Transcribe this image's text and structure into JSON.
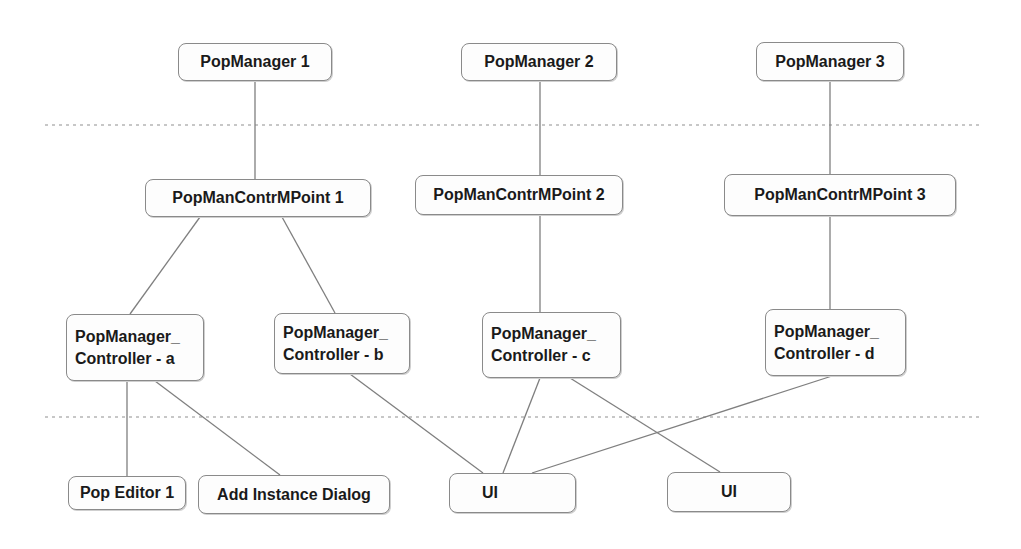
{
  "diagram": {
    "colors": {
      "edge": "#7f7f7f",
      "separator": "#b5b5b5",
      "node_border": "#8a8a8a",
      "text": "#1a1a1a"
    },
    "separators": [
      {
        "name": "separator-top",
        "x1": 45,
        "x2": 980,
        "y": 125
      },
      {
        "name": "separator-bottom",
        "x1": 45,
        "x2": 980,
        "y": 417
      }
    ],
    "nodes": {
      "pm1": {
        "label": "PopManager 1",
        "x": 178,
        "y": 43,
        "w": 154,
        "h": 38,
        "align": "center"
      },
      "pm2": {
        "label": "PopManager 2",
        "x": 461,
        "y": 43,
        "w": 156,
        "h": 38,
        "align": "center"
      },
      "pm3": {
        "label": "PopManager 3",
        "x": 756,
        "y": 42,
        "w": 148,
        "h": 39,
        "align": "center"
      },
      "cmp1": {
        "label": "PopManContrMPoint 1",
        "x": 145,
        "y": 179,
        "w": 226,
        "h": 38,
        "align": "center"
      },
      "cmp2": {
        "label": "PopManContrMPoint 2",
        "x": 415,
        "y": 175,
        "w": 208,
        "h": 40,
        "align": "center"
      },
      "cmp3": {
        "label": "PopManContrMPoint 3",
        "x": 724,
        "y": 174,
        "w": 232,
        "h": 42,
        "align": "center"
      },
      "ctla": {
        "label": "PopManager_\nController - a",
        "x": 66,
        "y": 314,
        "w": 138,
        "h": 67,
        "align": "left"
      },
      "ctlb": {
        "label": "PopManager_\nController - b",
        "x": 274,
        "y": 313,
        "w": 136,
        "h": 61,
        "align": "left"
      },
      "ctlc": {
        "label": "PopManager_\nController - c",
        "x": 482,
        "y": 312,
        "w": 139,
        "h": 66,
        "align": "left"
      },
      "ctld": {
        "label": "PopManager_\nController - d",
        "x": 765,
        "y": 309,
        "w": 141,
        "h": 67,
        "align": "left"
      },
      "ed1": {
        "label": "Pop Editor 1",
        "x": 68,
        "y": 476,
        "w": 118,
        "h": 34,
        "align": "center"
      },
      "aid": {
        "label": "Add Instance Dialog",
        "x": 198,
        "y": 475,
        "w": 192,
        "h": 39,
        "align": "center"
      },
      "ui1": {
        "label": "UI",
        "x": 449,
        "y": 473,
        "w": 127,
        "h": 40,
        "align": "left"
      },
      "ui2": {
        "label": "UI",
        "x": 667,
        "y": 472,
        "w": 124,
        "h": 40,
        "align": "center"
      }
    },
    "edges": [
      {
        "from": "pm1",
        "to": "cmp1",
        "x1": 255,
        "y1": 81,
        "x2": 255,
        "y2": 179
      },
      {
        "from": "pm2",
        "to": "cmp2",
        "x1": 540,
        "y1": 81,
        "x2": 540,
        "y2": 175
      },
      {
        "from": "pm3",
        "to": "cmp3",
        "x1": 830,
        "y1": 81,
        "x2": 830,
        "y2": 174
      },
      {
        "from": "cmp1",
        "to": "ctla",
        "x1": 200,
        "y1": 217,
        "x2": 130,
        "y2": 314
      },
      {
        "from": "cmp1",
        "to": "ctlb",
        "x1": 282,
        "y1": 217,
        "x2": 335,
        "y2": 313
      },
      {
        "from": "cmp2",
        "to": "ctlc",
        "x1": 540,
        "y1": 215,
        "x2": 540,
        "y2": 312
      },
      {
        "from": "cmp3",
        "to": "ctld",
        "x1": 830,
        "y1": 216,
        "x2": 830,
        "y2": 309
      },
      {
        "from": "ctla",
        "to": "ed1",
        "x1": 127,
        "y1": 381,
        "x2": 127,
        "y2": 476
      },
      {
        "from": "ctla",
        "to": "aid",
        "x1": 155,
        "y1": 381,
        "x2": 280,
        "y2": 475
      },
      {
        "from": "ctlb",
        "to": "ui1",
        "x1": 350,
        "y1": 374,
        "x2": 483,
        "y2": 473
      },
      {
        "from": "ctlc",
        "to": "ui1",
        "x1": 540,
        "y1": 378,
        "x2": 503,
        "y2": 473
      },
      {
        "from": "ctlc",
        "to": "ui2",
        "x1": 570,
        "y1": 378,
        "x2": 720,
        "y2": 472
      },
      {
        "from": "ctld",
        "to": "ui1",
        "x1": 832,
        "y1": 376,
        "x2": 532,
        "y2": 473
      }
    ]
  }
}
